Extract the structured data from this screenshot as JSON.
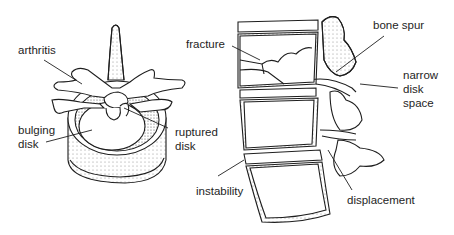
{
  "diagram": {
    "left_view": {
      "name": "vertebra-top-view",
      "labels": {
        "arthritis": "arthritis",
        "bulging_disk_1": "bulging",
        "bulging_disk_2": "disk",
        "ruptured_disk_1": "ruptured",
        "ruptured_disk_2": "disk"
      }
    },
    "right_view": {
      "name": "spine-side-view",
      "labels": {
        "fracture": "fracture",
        "bone_spur": "bone spur",
        "narrow_disk_space_1": "narrow",
        "narrow_disk_space_2": "disk",
        "narrow_disk_space_3": "space",
        "instability": "instability",
        "displacement": "displacement"
      }
    },
    "colors": {
      "ink": "#1e1e1e",
      "background": "#ffffff",
      "shade": "#8a8a8a"
    }
  }
}
